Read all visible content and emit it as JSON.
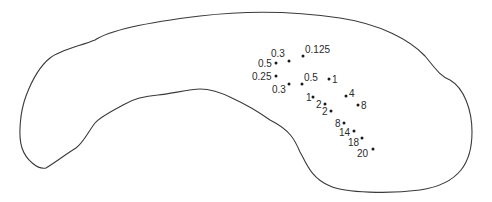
{
  "diagram": {
    "type": "labeled point map within organ outline",
    "outline_color": "#3a3a3a",
    "point_color": "#1a1a1a",
    "points": [
      {
        "label": "0.3",
        "x": 289,
        "y": 61,
        "lx": 271,
        "ly": 57,
        "anchor": "start"
      },
      {
        "label": "0.125",
        "x": 303,
        "y": 56,
        "lx": 305,
        "ly": 53,
        "anchor": "start"
      },
      {
        "label": "0.5",
        "x": 276,
        "y": 63,
        "lx": 258,
        "ly": 67,
        "anchor": "start"
      },
      {
        "label": "0.25",
        "x": 276,
        "y": 76,
        "lx": 252,
        "ly": 80,
        "anchor": "start"
      },
      {
        "label": "0.5",
        "x": 302,
        "y": 84,
        "lx": 304,
        "ly": 81,
        "anchor": "start"
      },
      {
        "label": "1",
        "x": 329,
        "y": 79,
        "lx": 332,
        "ly": 83,
        "anchor": "start"
      },
      {
        "label": "0.3",
        "x": 289,
        "y": 84,
        "lx": 272,
        "ly": 93,
        "anchor": "start"
      },
      {
        "label": "1",
        "x": 313,
        "y": 97,
        "lx": 306,
        "ly": 101,
        "anchor": "start"
      },
      {
        "label": "4",
        "x": 346,
        "y": 96,
        "lx": 349,
        "ly": 97,
        "anchor": "start"
      },
      {
        "label": "2",
        "x": 325,
        "y": 104,
        "lx": 316,
        "ly": 108,
        "anchor": "start"
      },
      {
        "label": "8",
        "x": 358,
        "y": 105,
        "lx": 361,
        "ly": 109,
        "anchor": "start"
      },
      {
        "label": "2",
        "x": 331,
        "y": 111,
        "lx": 322,
        "ly": 115,
        "anchor": "start"
      },
      {
        "label": "8",
        "x": 344,
        "y": 123,
        "lx": 335,
        "ly": 127,
        "anchor": "start"
      },
      {
        "label": "14",
        "x": 354,
        "y": 131,
        "lx": 339,
        "ly": 136,
        "anchor": "start"
      },
      {
        "label": "18",
        "x": 362,
        "y": 138,
        "lx": 348,
        "ly": 146,
        "anchor": "start"
      },
      {
        "label": "20",
        "x": 373,
        "y": 149,
        "lx": 357,
        "ly": 157,
        "anchor": "start"
      }
    ]
  }
}
